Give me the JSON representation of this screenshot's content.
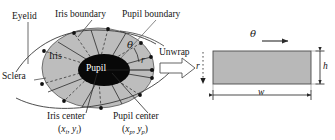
{
  "figure": {
    "kind": "iris-unwrap-diagram",
    "colors": {
      "iris_fill": "#bdbdbd",
      "pupil_fill": "#080808",
      "rect_fill": "#b8b8b8",
      "stroke": "#3a3a3a",
      "text": "#151515",
      "background": "#ffffff"
    }
  },
  "eye": {
    "labels": {
      "eyelid": "Eyelid",
      "iris_boundary": "Iris boundary",
      "pupil_boundary": "Pupil boundary",
      "sclera": "Sclera",
      "iris": "Iris",
      "pupil": "Pupil",
      "iris_center": "Iris center",
      "pupil_center": "Pupil center",
      "iris_center_coords_open": "(",
      "iris_center_x": "x",
      "iris_center_x_sub": "i",
      "iris_center_comma": ", ",
      "iris_center_y": "y",
      "iris_center_y_sub": "i",
      "iris_center_coords_close": ")",
      "pupil_center_x": "x",
      "pupil_center_x_sub": "p",
      "pupil_center_y": "y",
      "pupil_center_y_sub": "p",
      "theta": "θ",
      "radius": "r"
    }
  },
  "transform": {
    "label": "Unwrap",
    "radial_axis_label": "r"
  },
  "rectangle": {
    "theta_label": "θ",
    "height_label": "h",
    "width_label": "w"
  }
}
